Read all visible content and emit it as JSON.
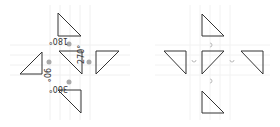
{
  "colors": {
    "stroke": "#333333",
    "dot": "#aaaaaa",
    "grid": "#f2f2f2",
    "label": "#333333",
    "arc": "#bbbbbb"
  },
  "left_diagram": {
    "labels": {
      "top": "180°",
      "left": "90°",
      "right": "270°",
      "bottom": "360°"
    }
  },
  "right_diagram": {
    "labels": {}
  }
}
